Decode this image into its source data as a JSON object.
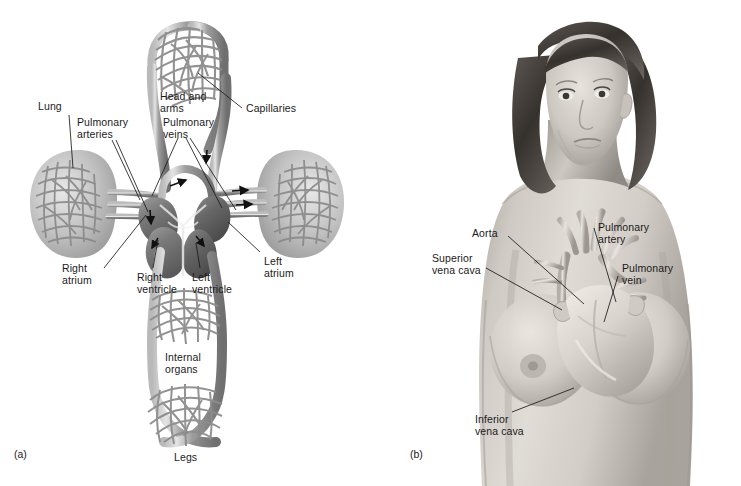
{
  "figure": {
    "background": "#ffffff",
    "ink": "#1a1a1a",
    "vessel_gray": "#8f8f8f",
    "vessel_gray_dark": "#6b6b6b",
    "skin_gray": "#c9c4bd",
    "width": 741,
    "height": 486
  },
  "panel_a": {
    "tag": "(a)",
    "caption": "Schematic diagram of the double circulation",
    "labels": {
      "lung": "Lung",
      "pulmonary_arteries": "Pulmonary\narteries",
      "pulmonary_veins": "Pulmonary\nveins",
      "head_and_arms": "Head and\narms",
      "capillaries": "Capillaries",
      "right_atrium": "Right\natrium",
      "right_ventricle": "Right\nventricle",
      "left_ventricle": "Left\nventricle",
      "left_atrium": "Left\natrium",
      "internal_organs": "Internal\norgans",
      "legs": "Legs"
    }
  },
  "panel_b": {
    "tag": "(b)",
    "caption": "Position of the heart and great vessels in the female thorax",
    "labels": {
      "aorta": "Aorta",
      "superior_vena_cava": "Superior\nvena cava",
      "pulmonary_artery": "Pulmonary\nartery",
      "pulmonary_vein": "Pulmonary\nvein",
      "inferior_vena_cava": "Inferior\nvena cava"
    }
  }
}
